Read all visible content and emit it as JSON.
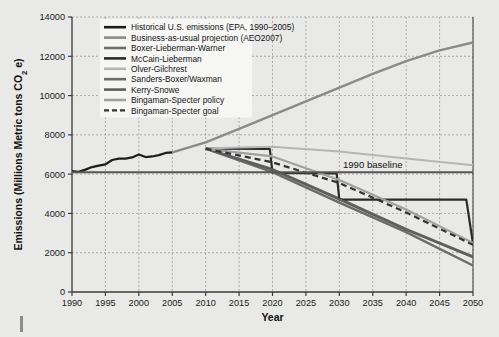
{
  "chart_data": {
    "type": "line",
    "title": "",
    "xlabel": "Year",
    "ylabel": "Emissions (Millions Metric tons CO2 e)",
    "ylabel_parts": {
      "main": "Emissions (Millions Metric tons CO",
      "sub": "2",
      "tail": " e)"
    },
    "xlim": [
      1990,
      2050
    ],
    "ylim": [
      0,
      14000
    ],
    "xticks": [
      1990,
      1995,
      2000,
      2005,
      2010,
      2015,
      2020,
      2025,
      2030,
      2035,
      2040,
      2045,
      2050
    ],
    "yticks": [
      0,
      2000,
      4000,
      6000,
      8000,
      10000,
      12000,
      14000
    ],
    "grid": true,
    "legend_position": "top-left",
    "annotations": [
      {
        "text": "1990 baseline",
        "x": 2035,
        "y": 6100,
        "name": "baseline-annotation"
      }
    ],
    "series": [
      {
        "name": "Historical U.S. emissions (EPA, 1990–2005)",
        "color": "#1c1c1c",
        "width": 2.2,
        "dash": "none",
        "x": [
          1990,
          1991,
          1992,
          1993,
          1994,
          1995,
          1996,
          1997,
          1998,
          1999,
          2000,
          2001,
          2002,
          2003,
          2004,
          2005
        ],
        "y": [
          6150,
          6120,
          6230,
          6360,
          6430,
          6500,
          6720,
          6790,
          6790,
          6850,
          7000,
          6870,
          6900,
          6970,
          7080,
          7110
        ]
      },
      {
        "name": "Business-as-usual projection (AEO2007)",
        "color": "#8a8a8a",
        "width": 2.4,
        "dash": "none",
        "x": [
          2005,
          2010,
          2015,
          2020,
          2025,
          2030,
          2035,
          2040,
          2045,
          2050
        ],
        "y": [
          7110,
          7620,
          8300,
          9000,
          9700,
          10400,
          11100,
          11750,
          12300,
          12700
        ]
      },
      {
        "name": "Boxer-Lieberman-Warner",
        "color": "#6f6f6f",
        "width": 2.4,
        "dash": "none",
        "x": [
          2010,
          2020,
          2030,
          2040,
          2050
        ],
        "y": [
          7300,
          6250,
          4750,
          3200,
          1800
        ]
      },
      {
        "name": "McCain-Lieberman",
        "color": "#2a2a2a",
        "width": 2.2,
        "dash": "none",
        "x": [
          2010,
          2019.6,
          2020,
          2029.6,
          2030,
          2049,
          2050
        ],
        "y": [
          7300,
          7280,
          6060,
          6040,
          4700,
          4700,
          2450
        ]
      },
      {
        "name": "Olver-Gilchrest",
        "color": "#b5b5b5",
        "width": 2.0,
        "dash": "none",
        "x": [
          2010,
          2015,
          2020,
          2030,
          2040,
          2050
        ],
        "y": [
          7300,
          7360,
          7400,
          7150,
          6800,
          6450
        ]
      },
      {
        "name": "Sanders-Boxer/Waxman",
        "color": "#6b6b6b",
        "width": 2.4,
        "dash": "none",
        "x": [
          2010,
          2020,
          2030,
          2040,
          2050
        ],
        "y": [
          7300,
          6100,
          4550,
          3050,
          1350
        ]
      },
      {
        "name": "Kerry-Snowe",
        "color": "#5e5e5e",
        "width": 2.4,
        "dash": "none",
        "x": [
          2010,
          2020,
          2030,
          2040,
          2050
        ],
        "y": [
          7300,
          6230,
          4720,
          3180,
          1780
        ]
      },
      {
        "name": "Bingaman-Specter policy",
        "color": "#a0a0a0",
        "width": 2.2,
        "dash": "none",
        "x": [
          2010,
          2020,
          2030,
          2040,
          2050
        ],
        "y": [
          7290,
          6900,
          5700,
          4200,
          2500
        ]
      },
      {
        "name": "Bingaman-Specter goal",
        "color": "#333333",
        "width": 2.2,
        "dash": "dashed",
        "x": [
          2010,
          2020,
          2030,
          2040,
          2050
        ],
        "y": [
          7300,
          6600,
          5550,
          4050,
          2400
        ]
      },
      {
        "name": "1990 baseline",
        "color": "#555555",
        "width": 2.0,
        "dash": "none",
        "hide_from_legend": true,
        "x": [
          1990,
          2050
        ],
        "y": [
          6100,
          6100
        ]
      }
    ],
    "legend": [
      {
        "label": "Historical U.S. emissions (EPA, 1990–2005)",
        "color": "#1c1c1c",
        "dash": "none",
        "width": 2.6
      },
      {
        "label": "Business-as-usual projection (AEO2007)",
        "color": "#8a8a8a",
        "dash": "none",
        "width": 2.6
      },
      {
        "label": "Boxer-Lieberman-Warner",
        "color": "#6f6f6f",
        "dash": "none",
        "width": 2.6
      },
      {
        "label": "McCain-Lieberman",
        "color": "#2a2a2a",
        "dash": "none",
        "width": 2.6
      },
      {
        "label": "Olver-Gilchrest",
        "color": "#b5b5b5",
        "dash": "none",
        "width": 2.6
      },
      {
        "label": "Sanders-Boxer/Waxman",
        "color": "#6b6b6b",
        "dash": "none",
        "width": 2.6
      },
      {
        "label": "Kerry-Snowe",
        "color": "#5e5e5e",
        "dash": "none",
        "width": 2.6
      },
      {
        "label": "Bingaman-Specter policy",
        "color": "#a0a0a0",
        "dash": "none",
        "width": 2.6
      },
      {
        "label": "Bingaman-Specter goal",
        "color": "#333333",
        "dash": "dashed",
        "width": 2.2
      }
    ]
  },
  "style": {
    "page_background": "#e9e9e7",
    "plot_background": "#e9e9e7",
    "grid_color": "#9a9a9a",
    "axis_color": "#3a3a3a",
    "legend_background": "#f6f6f4"
  }
}
